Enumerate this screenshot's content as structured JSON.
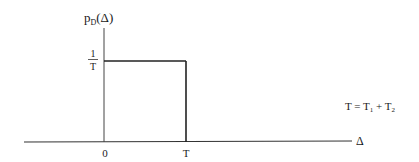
{
  "diagram": {
    "type": "probability-density-plot",
    "y_axis_label": {
      "main": "p",
      "subscript": "D",
      "arg": "(Δ)"
    },
    "x_axis_label": "Δ",
    "y_tick": {
      "numerator": "1",
      "denominator": "T"
    },
    "x_ticks": [
      "0",
      "T"
    ],
    "annotation": {
      "lhs": "T = T",
      "sub1": "1",
      "plus": " + T",
      "sub2": "2"
    },
    "colors": {
      "line": "#222222",
      "axis": "#333333",
      "text": "#1a1a1a"
    }
  }
}
